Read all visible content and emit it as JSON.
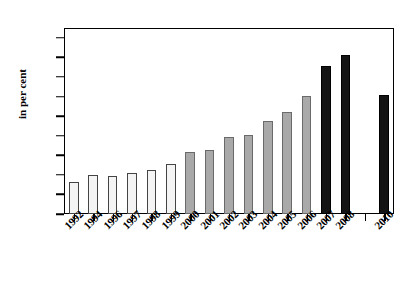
{
  "chart_data": {
    "type": "bar",
    "title": "",
    "subtitle": "",
    "xlabel": "",
    "ylabel": "in per cent",
    "ylim": [
      0,
      19
    ],
    "yticks": [
      0,
      2,
      4,
      6,
      8,
      10,
      12,
      14,
      16,
      18
    ],
    "ytick_labels": [
      "0",
      "2",
      "4",
      "6",
      "8",
      "10",
      "12",
      "14",
      "16",
      "18"
    ],
    "grid": false,
    "legend": null,
    "legend_position": "none",
    "categories": [
      "1992",
      "1994",
      "1996",
      "1997",
      "1998",
      "1999",
      "2000",
      "2001",
      "2002",
      "2003",
      "2004",
      "2005",
      "2006",
      "2007",
      "2008",
      "2009",
      "2010"
    ],
    "values": [
      3.3,
      4.0,
      3.9,
      4.2,
      4.5,
      5.1,
      6.35,
      6.55,
      7.9,
      8.05,
      9.5,
      10.45,
      12.1,
      15.1,
      16.2,
      null,
      12.2
    ],
    "bar_styles": [
      "white",
      "white",
      "white",
      "white",
      "white",
      "white",
      "gray",
      "gray",
      "gray",
      "gray",
      "gray",
      "gray",
      "gray",
      "black",
      "black",
      "none",
      "black"
    ],
    "colors": {
      "white_bar_fill": "#f4f4f4",
      "white_bar_edge": "#444444",
      "gray_bar_fill": "#a9a9a9",
      "gray_bar_edge": "#6a6a6a",
      "black_bar_fill": "#141414",
      "black_bar_edge": "#000000",
      "axis": "#000000",
      "background": "#ffffff"
    }
  }
}
